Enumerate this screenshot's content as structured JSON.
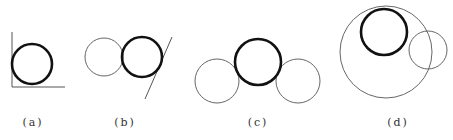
{
  "colors": {
    "background": "#ffffff",
    "thick_stroke": "#111111",
    "thin_stroke": "#555555",
    "label": "#333333"
  },
  "panels": [
    {
      "id": "a",
      "label": "(a)",
      "description": "Thick circle tangent to two perpendicular lines (corner)",
      "thick_circle": {
        "cx": 32,
        "cy": 64,
        "r": 20
      },
      "lines": [
        {
          "x1": 12,
          "y1": 32,
          "x2": 12,
          "y2": 87
        },
        {
          "x1": 12,
          "y1": 87,
          "x2": 65,
          "y2": 87
        }
      ],
      "thin_circles": []
    },
    {
      "id": "b",
      "label": "(b)",
      "description": "Thick circle tangent to a thin circle and a slanted line",
      "thick_circle": {
        "cx": 142,
        "cy": 57,
        "r": 20
      },
      "lines": [
        {
          "x1": 172,
          "y1": 37,
          "x2": 145,
          "y2": 99
        }
      ],
      "thin_circles": [
        {
          "cx": 104,
          "cy": 57,
          "r": 19
        }
      ]
    },
    {
      "id": "c",
      "label": "(c)",
      "description": "Thick circle tangent to two thin circles",
      "thick_circle": {
        "cx": 258,
        "cy": 62,
        "r": 23
      },
      "lines": [],
      "thin_circles": [
        {
          "cx": 217,
          "cy": 81,
          "r": 22
        },
        {
          "cx": 298,
          "cy": 81,
          "r": 22
        }
      ]
    },
    {
      "id": "d",
      "label": "(d)",
      "description": "Thick circle tangent to a thin circle and internally tangent to a large enclosing circle",
      "thick_circle": {
        "cx": 384,
        "cy": 32,
        "r": 23
      },
      "lines": [],
      "thin_circles": [
        {
          "cx": 386,
          "cy": 52,
          "r": 46
        },
        {
          "cx": 428,
          "cy": 50,
          "r": 19
        }
      ]
    }
  ]
}
